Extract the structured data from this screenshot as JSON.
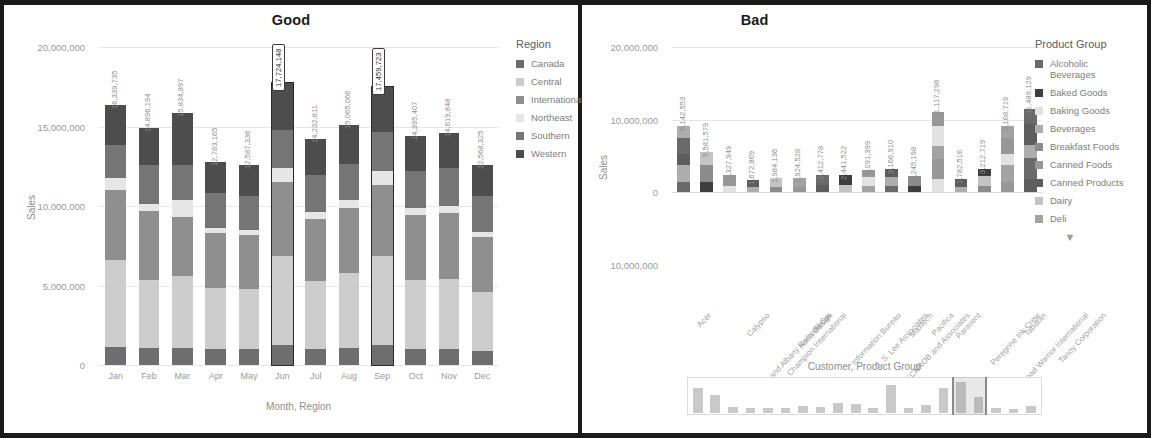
{
  "panels": {
    "left": {
      "title": "Good"
    },
    "right": {
      "title": "Bad"
    }
  },
  "left_chart": {
    "ylabel": "Sales",
    "xlabel": "Month, Region",
    "legend_title": "Region"
  },
  "right_chart": {
    "ylabel": "Sales",
    "legend_title": "Product Group",
    "legend_more_icon": "chevron-down-icon",
    "mini_title": "Customer, Product Group"
  },
  "chart_data": [
    {
      "type": "bar",
      "subtype": "stacked-column",
      "title": "Good",
      "xlabel": "Month, Region",
      "ylabel": "Sales",
      "ylim": [
        0,
        20000000
      ],
      "yticks": [
        "0",
        "5,000,000",
        "10,000,000",
        "15,000,000",
        "20,000,000"
      ],
      "ytick_values": [
        0,
        5000000,
        10000000,
        15000000,
        20000000
      ],
      "grid": true,
      "legend_position": "right",
      "legend_title": "Region",
      "categories": [
        "Jan",
        "Feb",
        "Mar",
        "Apr",
        "May",
        "Jun",
        "Jul",
        "Aug",
        "Sep",
        "Oct",
        "Nov",
        "Dec"
      ],
      "totals": [
        16339735,
        14896194,
        15834897,
        12783165,
        12587336,
        17724148,
        14232811,
        15065066,
        17459723,
        14395407,
        14619848,
        12568325
      ],
      "total_labels": [
        "16,339,735",
        "14,896,194",
        "15,834,897",
        "12,783,165",
        "12,587,336",
        "17,724,148",
        "14,232,811",
        "15,065,066",
        "17,459,723",
        "14,395,407",
        "14,619,848",
        "12,568,325"
      ],
      "highlighted_categories": [
        "Jun",
        "Sep"
      ],
      "series": [
        {
          "name": "Canada",
          "color": "#6e6e6e",
          "values": [
            1150000,
            1050000,
            1100000,
            980000,
            1000000,
            1250000,
            1000000,
            1060000,
            1230000,
            1010000,
            1030000,
            880000
          ]
        },
        {
          "name": "Central",
          "color": "#cdcdcd",
          "values": [
            5450000,
            4300000,
            4500000,
            3850000,
            3750000,
            5600000,
            4300000,
            4700000,
            5600000,
            4350000,
            4400000,
            3700000
          ]
        },
        {
          "name": "International",
          "color": "#8f8f8f",
          "values": [
            4400000,
            4350000,
            3700000,
            3450000,
            3400000,
            4650000,
            3900000,
            4100000,
            4500000,
            4100000,
            4150000,
            3450000
          ]
        },
        {
          "name": "Northeast",
          "color": "#e6e6e6",
          "values": [
            780000,
            400000,
            1100000,
            350000,
            330000,
            900000,
            400000,
            500000,
            850000,
            400000,
            420000,
            330000
          ]
        },
        {
          "name": "Southern",
          "color": "#757575",
          "values": [
            2050000,
            2450000,
            2200000,
            2200000,
            2150000,
            2400000,
            2350000,
            2300000,
            2500000,
            2350000,
            2400000,
            2250000
          ]
        },
        {
          "name": "Western",
          "color": "#4d4d4d",
          "values": [
            2509735,
            2346194,
            3234897,
            1953165,
            1957336,
            2924148,
            2282811,
            2405066,
            2779723,
            2185407,
            2219848,
            1958325
          ]
        }
      ]
    },
    {
      "type": "bar",
      "subtype": "stacked-column",
      "title": "Bad",
      "xlabel": "",
      "ylabel": "Sales",
      "ylim": [
        -10000000,
        20000000
      ],
      "yticks": [
        "20,000,000",
        "10,000,000",
        "0",
        "10,000,000"
      ],
      "ytick_values": [
        20000000,
        10000000,
        0,
        -10000000
      ],
      "grid": true,
      "legend_position": "right",
      "legend_title": "Product Group",
      "categories": [
        "Acer",
        "Boston and Albany Railroad Co.",
        "Calypso",
        "Champion International",
        "Kona Design",
        "Focus",
        "Information Bureau",
        "J. S. Lee Associates",
        "KCNROB and Associates",
        "Maxtech",
        "Pacifica",
        "Paravent",
        "Peregrine Ink Crew",
        "Road Warrior International",
        "Tabatan",
        "Tanoy Corporation"
      ],
      "values": [
        9142553,
        5581579,
        2327949,
        1672869,
        1984136,
        1924528,
        2412778,
        2441522,
        3091399,
        3166910,
        2245198,
        11117296,
        1782516,
        3212719,
        9168719,
        11489129
      ],
      "value_labels": [
        "9,142,553",
        "5,581,579",
        "2,327,949",
        "1,672,869",
        "1,984,136",
        "1,924,528",
        "2,412,778",
        "2,441,522",
        "3,091,399",
        "3,166,910",
        "2,245,198",
        "11,117,296",
        "1,782,516",
        "3,212,719",
        "9,168,719",
        "11,489,129"
      ],
      "legend_entries": [
        {
          "name": "Alcoholic Beverages",
          "color": "#6a6a6a"
        },
        {
          "name": "Baked Goods",
          "color": "#3e3e3e"
        },
        {
          "name": "Baking Goods",
          "color": "#e2e2e2"
        },
        {
          "name": "Beverages",
          "color": "#adadad"
        },
        {
          "name": "Breakfast Foods",
          "color": "#8b8b8b"
        },
        {
          "name": "Canned Foods",
          "color": "#979797"
        },
        {
          "name": "Canned Products",
          "color": "#5d5d5d"
        },
        {
          "name": "Dairy",
          "color": "#c4c4c4"
        },
        {
          "name": "Deli",
          "color": "#a3a3a3"
        }
      ]
    }
  ],
  "mini_chart": {
    "title": "Customer, Product Group",
    "values": [
      62,
      44,
      14,
      12,
      13,
      12,
      17,
      15,
      26,
      22,
      13,
      70,
      12,
      20,
      62,
      78,
      40,
      12,
      11,
      18
    ],
    "selection_start_index": 15,
    "selection_end_index": 16
  }
}
